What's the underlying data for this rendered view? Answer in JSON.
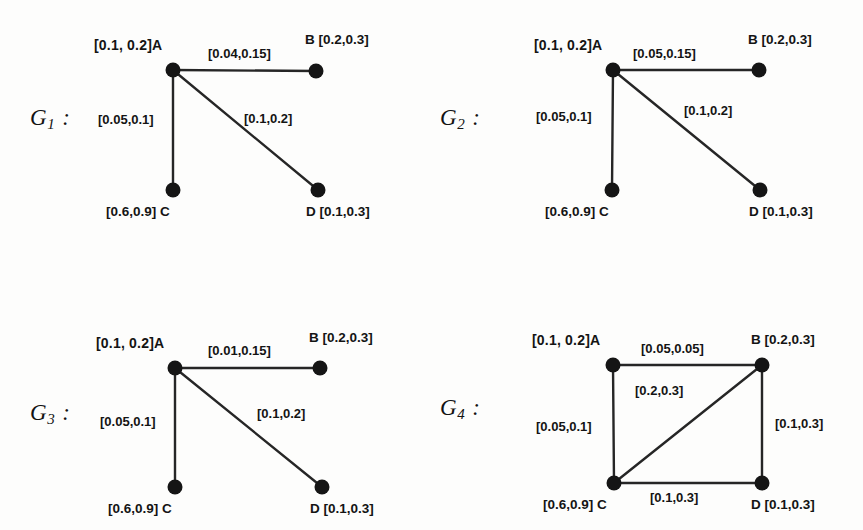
{
  "figure": {
    "background": "#fdfdfc",
    "ink": "#151515",
    "panel_count": 4
  },
  "graphs": [
    {
      "id": "g1",
      "name_base": "G",
      "name_sub": "1",
      "name_colon": ":",
      "vertices": [
        {
          "key": "a",
          "label": "[0.1, 0.2]A",
          "interval": "[0.1, 0.2]",
          "letter": "A"
        },
        {
          "key": "b",
          "label": "B [0.2,0.3]",
          "interval": "[0.2,0.3]",
          "letter": "B"
        },
        {
          "key": "c",
          "label": "[0.6,0.9] C",
          "interval": "[0.6,0.9]",
          "letter": "C"
        },
        {
          "key": "d",
          "label": "D [0.1,0.3]",
          "interval": "[0.1,0.3]",
          "letter": "D"
        }
      ],
      "edges": [
        {
          "from": "A",
          "to": "B",
          "label": "[0.04,0.15]"
        },
        {
          "from": "A",
          "to": "C",
          "label": "[0.05,0.1]"
        },
        {
          "from": "A",
          "to": "D",
          "label": "[0.1,0.2]"
        }
      ]
    },
    {
      "id": "g2",
      "name_base": "G",
      "name_sub": "2",
      "name_colon": ":",
      "vertices": [
        {
          "key": "a",
          "label": "[0.1, 0.2]A",
          "interval": "[0.1, 0.2]",
          "letter": "A"
        },
        {
          "key": "b",
          "label": "B [0.2,0.3]",
          "interval": "[0.2,0.3]",
          "letter": "B"
        },
        {
          "key": "c",
          "label": "[0.6,0.9] C",
          "interval": "[0.6,0.9]",
          "letter": "C"
        },
        {
          "key": "d",
          "label": "D [0.1,0.3]",
          "interval": "[0.1,0.3]",
          "letter": "D"
        }
      ],
      "edges": [
        {
          "from": "A",
          "to": "B",
          "label": "[0.05,0.15]"
        },
        {
          "from": "A",
          "to": "C",
          "label": "[0.05,0.1]"
        },
        {
          "from": "A",
          "to": "D",
          "label": "[0.1,0.2]"
        }
      ]
    },
    {
      "id": "g3",
      "name_base": "G",
      "name_sub": "3",
      "name_colon": ":",
      "vertices": [
        {
          "key": "a",
          "label": "[0.1, 0.2]A",
          "interval": "[0.1, 0.2]",
          "letter": "A"
        },
        {
          "key": "b",
          "label": "B [0.2,0.3]",
          "interval": "[0.2,0.3]",
          "letter": "B"
        },
        {
          "key": "c",
          "label": "[0.6,0.9] C",
          "interval": "[0.6,0.9]",
          "letter": "C"
        },
        {
          "key": "d",
          "label": "D [0.1,0.3]",
          "interval": "[0.1,0.3]",
          "letter": "D"
        }
      ],
      "edges": [
        {
          "from": "A",
          "to": "B",
          "label": "[0.01,0.15]"
        },
        {
          "from": "A",
          "to": "C",
          "label": "[0.05,0.1]"
        },
        {
          "from": "A",
          "to": "D",
          "label": "[0.1,0.2]"
        }
      ]
    },
    {
      "id": "g4",
      "name_base": "G",
      "name_sub": "4",
      "name_colon": ":",
      "vertices": [
        {
          "key": "a",
          "label": "[0.1, 0.2]A",
          "interval": "[0.1, 0.2]",
          "letter": "A"
        },
        {
          "key": "b",
          "label": "B [0.2,0.3]",
          "interval": "[0.2,0.3]",
          "letter": "B"
        },
        {
          "key": "c",
          "label": "[0.6,0.9] C",
          "interval": "[0.6,0.9]",
          "letter": "C"
        },
        {
          "key": "d",
          "label": "D [0.1,0.3]",
          "interval": "[0.1,0.3]",
          "letter": "D"
        }
      ],
      "edges": [
        {
          "from": "A",
          "to": "B",
          "label": "[0.05,0.05]"
        },
        {
          "from": "A",
          "to": "C",
          "label": "[0.05,0.1]"
        },
        {
          "from": "C",
          "to": "B",
          "label": "[0.2,0.3]"
        },
        {
          "from": "B",
          "to": "D",
          "label": "[0.1,0.3]"
        },
        {
          "from": "C",
          "to": "D",
          "label": "[0.1,0.3]"
        }
      ]
    }
  ]
}
